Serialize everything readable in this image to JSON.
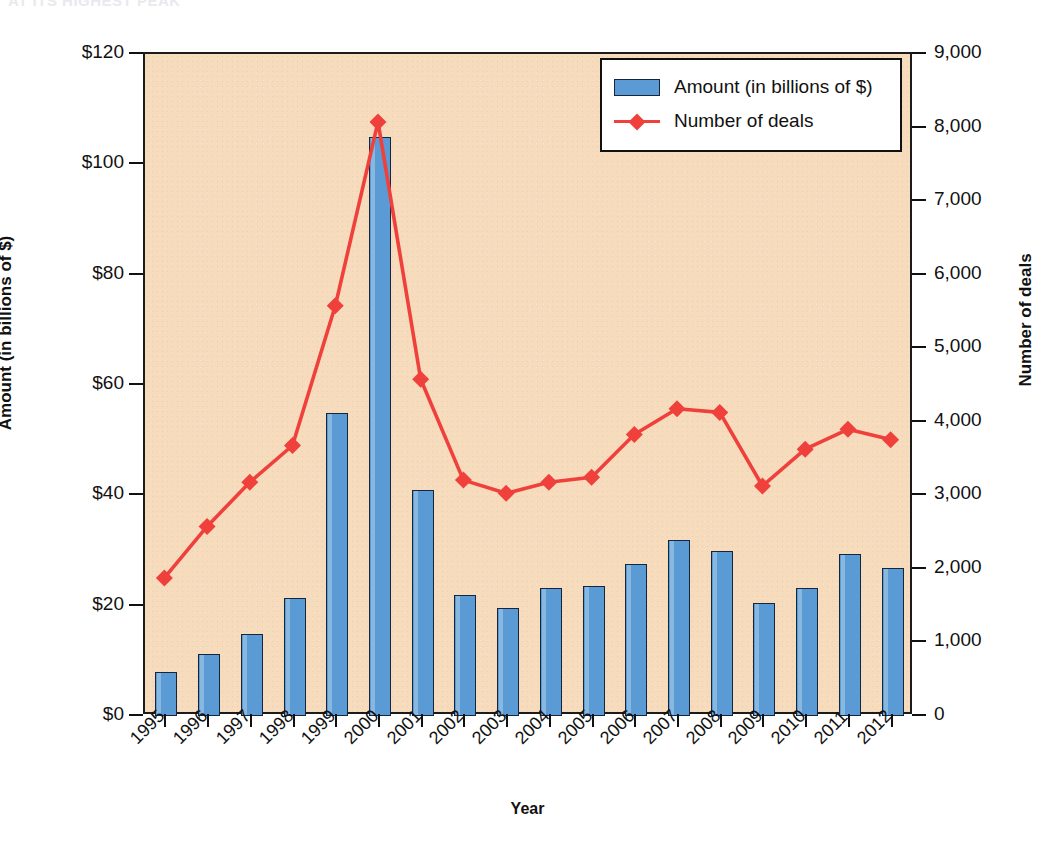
{
  "clipped_heading": "AT ITS HIGHEST PEAK",
  "chart_data": {
    "type": "bar",
    "title": "",
    "xlabel": "Year",
    "ylabel": "Amount (in billions of $)",
    "y2label": "Number of deals",
    "grid": false,
    "legend_position": "top-right",
    "categories": [
      "1995",
      "1996",
      "1997",
      "1998",
      "1999",
      "2000",
      "2001",
      "2002",
      "2003",
      "2004",
      "2005",
      "2006",
      "2007",
      "2008",
      "2009",
      "2010",
      "2011",
      "2012"
    ],
    "ylim": [
      0,
      120
    ],
    "y2lim": [
      0,
      9000
    ],
    "yticks": [
      "$0",
      "$20",
      "$40",
      "$60",
      "$80",
      "$100",
      "$120"
    ],
    "ytick_values": [
      0,
      20,
      40,
      60,
      80,
      100,
      120
    ],
    "y2ticks": [
      "0",
      "1,000",
      "2,000",
      "3,000",
      "4,000",
      "5,000",
      "6,000",
      "7,000",
      "8,000",
      "9,000"
    ],
    "y2tick_values": [
      0,
      1000,
      2000,
      3000,
      4000,
      5000,
      6000,
      7000,
      8000,
      9000
    ],
    "series": [
      {
        "name": "Amount (in billions of $)",
        "type": "bar",
        "axis": "left",
        "color": "#5b9bd5",
        "edge_color": "#17253c",
        "values": [
          8.0,
          11.3,
          14.8,
          21.3,
          54.9,
          105.0,
          41.0,
          22.0,
          19.6,
          23.2,
          23.6,
          27.5,
          31.9,
          30.0,
          20.4,
          23.2,
          29.4,
          26.8
        ]
      },
      {
        "name": "Number of deals",
        "type": "line",
        "axis": "right",
        "color": "#f0403c",
        "marker": "diamond",
        "values": [
          1850,
          2550,
          3150,
          3650,
          5550,
          8050,
          4550,
          3180,
          3000,
          3150,
          3220,
          3800,
          4150,
          4100,
          3100,
          3600,
          3870,
          3730
        ]
      }
    ]
  },
  "colors": {
    "plot_background": "#f6dcbd",
    "bar_fill": "#5b9bd5",
    "bar_edge": "#17253c",
    "line": "#f0403c",
    "axis": "#111111",
    "page_background": "#ffffff"
  }
}
